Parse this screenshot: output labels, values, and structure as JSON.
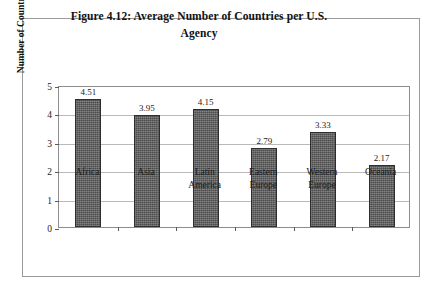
{
  "figure": {
    "title_line1": "Figure 4.12: Average Number of Countries per U.S.",
    "title_line2": "Agency"
  },
  "chart_data": {
    "type": "bar",
    "title": "Figure 4.12: Average Number of Countries per U.S. Agency",
    "xlabel": "",
    "ylabel": "Number of Countries",
    "ylim": [
      0,
      5
    ],
    "yticks": [
      "0",
      "1",
      "2",
      "3",
      "4",
      "5"
    ],
    "grid": true,
    "legend": "none",
    "bar_color": "#5d5d5d",
    "categories": [
      "Africa",
      "Latin America",
      "Eastern Europe",
      "Western Europe",
      "Asia",
      "Oceania"
    ],
    "category_lines": [
      [
        "Africa"
      ],
      [
        "Asia"
      ],
      [
        "Latin",
        "America"
      ],
      [
        "Eastern",
        "Europe"
      ],
      [
        "Western",
        "Europe"
      ],
      [
        "Oceania"
      ]
    ],
    "values": [
      4.51,
      3.95,
      4.15,
      2.79,
      3.33,
      2.17
    ],
    "value_labels": [
      "4.51",
      "3.95",
      "4.15",
      "2.79",
      "3.33",
      "2.17"
    ]
  }
}
